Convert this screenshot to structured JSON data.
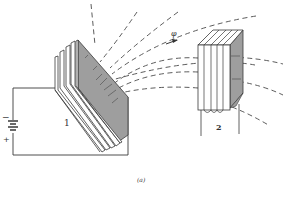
{
  "figure": {
    "caption": "(a)",
    "coil1_label": "1",
    "coil2_label": "2",
    "flux_label": "φ",
    "battery_minus": "−",
    "battery_plus": "+"
  },
  "colors": {
    "line": "#3a3a3a",
    "dash": "#4a4a4a",
    "core_shade": "#9e9e9e",
    "background": "#ffffff"
  }
}
